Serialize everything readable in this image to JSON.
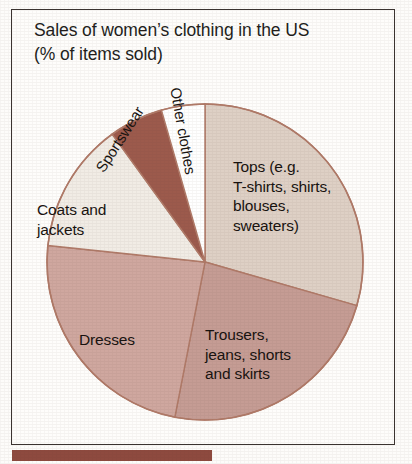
{
  "figure": {
    "title_line_1": "Sales of women’s clothing in the US",
    "title_line_2": "(% of items sold)"
  },
  "chart_data": {
    "type": "pie",
    "title": "Sales of women’s clothing in the US (% of items sold)",
    "subtitle": "(% of items sold)",
    "unit": "% of items sold",
    "legend": "none (labels drawn inside/around slices)",
    "start_angle_deg": 0,
    "direction": "clockwise",
    "categories": [
      "Tops (e.g. T-shirts, shirts, blouses, sweaters)",
      "Trousers, jeans, shorts and skirts",
      "Dresses",
      "Coats and jackets",
      "Sportswear",
      "Other clothes"
    ],
    "values": [
      29,
      24,
      24,
      13,
      6,
      4
    ],
    "slices": [
      {
        "label": "Tops (e.g.\nT-shirts, shirts,\nblouses,\nsweaters)",
        "name": "Tops (e.g. T-shirts, shirts, blouses, sweaters)",
        "value": 29,
        "start_deg": 0,
        "end_deg": 106,
        "color": "#ded0c5"
      },
      {
        "label": "Trousers,\njeans, shorts\nand skirts",
        "name": "Trousers, jeans, shorts and skirts",
        "value": 24,
        "start_deg": 106,
        "end_deg": 191,
        "color": "#c59c94"
      },
      {
        "label": "Dresses",
        "name": "Dresses",
        "value": 24,
        "start_deg": 191,
        "end_deg": 276,
        "color": "#cfa79f"
      },
      {
        "label": "Coats and\njackets",
        "name": "Coats and jackets",
        "value": 13,
        "start_deg": 276,
        "end_deg": 324,
        "color": "#f1ece5"
      },
      {
        "label": "Sportswear",
        "name": "Sportswear",
        "value": 6,
        "start_deg": 324,
        "end_deg": 344,
        "color": "#9c5a4c"
      },
      {
        "label": "Other clothes",
        "name": "Other clothes",
        "value": 4,
        "start_deg": 344,
        "end_deg": 360,
        "color": "#ffffff"
      }
    ],
    "colors": {
      "tops": "#ded0c5",
      "trousers": "#c59c94",
      "dresses": "#cfa79f",
      "coats": "#f1ece5",
      "sportswear": "#9c5a4c",
      "other": "#ffffff",
      "outline": "#b07a68",
      "accent_bar": "#8e4a3f",
      "frame": "#3a3330",
      "text": "#17120f"
    }
  }
}
